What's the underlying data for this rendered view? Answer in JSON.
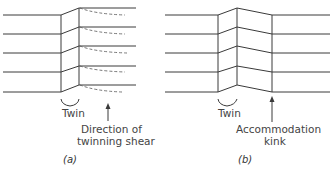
{
  "figure": {
    "panel_a": {
      "caption": "(a)",
      "twin_label": "Twin",
      "arrow_label_line1": "Direction of",
      "arrow_label_line2": "twinning shear"
    },
    "panel_b": {
      "caption": "(b)",
      "twin_label": "Twin",
      "arrow_label_line1": "Accommodation",
      "arrow_label_line2": "kink"
    },
    "line_color": "#3a3a3a"
  }
}
